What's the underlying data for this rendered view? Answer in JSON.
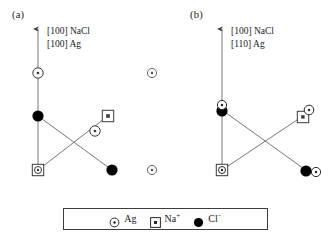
{
  "figure": {
    "type": "crystal-orientation-schematic",
    "background": "#ffffff",
    "line_color": "#555555",
    "stroke_color": "#1a1a1a",
    "fill_color": "#000000",
    "width": 335,
    "height": 238
  },
  "panels": [
    {
      "id": "a",
      "tag": "(a)",
      "direction_labels": {
        "substrate": "[100] NaCl",
        "film": "[100] Ag"
      },
      "arrow": {
        "label": "up-arrow",
        "x": 38,
        "y_top": 28,
        "y_bottom": 74
      },
      "atoms": [
        {
          "species": "Ag",
          "x": 38,
          "y": 73,
          "overlap": null
        },
        {
          "species": "Cl",
          "x": 38,
          "y": 116,
          "overlap": null
        },
        {
          "species": "Na",
          "x": 38,
          "y": 170,
          "overlap": "Ag"
        },
        {
          "species": "Na",
          "x": 108,
          "y": 116,
          "overlap": null
        },
        {
          "species": "Ag",
          "x": 95,
          "y": 131,
          "overlap": null
        },
        {
          "species": "Cl",
          "x": 112,
          "y": 170,
          "overlap": null
        },
        {
          "species": "Ag",
          "x": 152,
          "y": 73,
          "overlap": null
        },
        {
          "species": "Ag",
          "x": 152,
          "y": 170,
          "overlap": null
        }
      ],
      "bonds": [
        {
          "from": [
            38,
            73
          ],
          "to": [
            38,
            116
          ]
        },
        {
          "from": [
            38,
            116
          ],
          "to": [
            38,
            170
          ]
        },
        {
          "from": [
            38,
            116
          ],
          "to": [
            112,
            170
          ]
        },
        {
          "from": [
            38,
            170
          ],
          "to": [
            108,
            116
          ]
        }
      ]
    },
    {
      "id": "b",
      "tag": "(b)",
      "direction_labels": {
        "substrate": "[100] NaCl",
        "film": "[110] Ag"
      },
      "arrow": {
        "label": "up-arrow",
        "x": 222,
        "y_top": 28,
        "y_bottom": 74
      },
      "atoms": [
        {
          "species": "Ag",
          "x": 222,
          "y": 104,
          "overlap": "Cl"
        },
        {
          "species": "Cl",
          "x": 222,
          "y": 110,
          "overlap": "Ag"
        },
        {
          "species": "Na",
          "x": 222,
          "y": 170,
          "overlap": "Ag"
        },
        {
          "species": "Na",
          "x": 303,
          "y": 116,
          "overlap": "Ag"
        },
        {
          "species": "Ag",
          "x": 310,
          "y": 110,
          "overlap": "Na"
        },
        {
          "species": "Cl",
          "x": 307,
          "y": 171,
          "overlap": "Ag"
        },
        {
          "species": "Ag",
          "x": 316,
          "y": 173,
          "overlap": "Cl"
        }
      ],
      "bonds": [
        {
          "from": [
            222,
            28
          ],
          "to": [
            222,
            170
          ]
        },
        {
          "from": [
            222,
            110
          ],
          "to": [
            307,
            171
          ]
        },
        {
          "from": [
            222,
            170
          ],
          "to": [
            303,
            116
          ]
        }
      ]
    }
  ],
  "legend": {
    "entries": [
      {
        "symbol": "circle-dot",
        "label": "Ag",
        "icon": "ag-circle-icon"
      },
      {
        "symbol": "square-dot",
        "label": "Na",
        "charge": "+",
        "icon": "na-square-icon"
      },
      {
        "symbol": "filled-circle",
        "label": "Cl",
        "charge": "−",
        "icon": "cl-filled-circle-icon"
      }
    ]
  }
}
